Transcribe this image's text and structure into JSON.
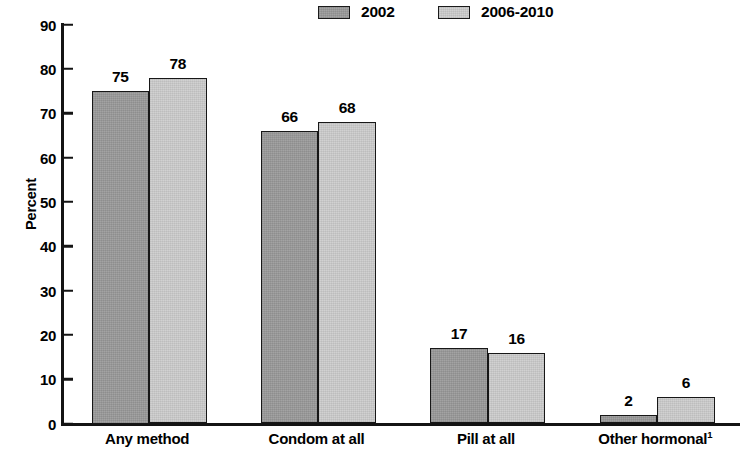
{
  "chart_data": {
    "type": "bar",
    "title": "",
    "subtitle": "",
    "xlabel": "",
    "ylabel": "Percent",
    "ylim": [
      0,
      90
    ],
    "ytick_step": 10,
    "yticks": [
      "90",
      "80",
      "70",
      "60",
      "50",
      "40",
      "30",
      "20",
      "10",
      "0"
    ],
    "grid": false,
    "legend_position": "top-center",
    "categories": [
      "Any method",
      "Condom at all",
      "Pill at all",
      "Other hormonal"
    ],
    "category_footnotes": [
      "",
      "",
      "",
      "1"
    ],
    "series": [
      {
        "name": "2002",
        "color": "#9a9a9a",
        "values": [
          75,
          66,
          17,
          2
        ]
      },
      {
        "name": "2006-2010",
        "color": "#cdcdcd",
        "values": [
          78,
          68,
          16,
          6
        ]
      }
    ],
    "bar_labels": [
      [
        "75",
        "78"
      ],
      [
        "66",
        "68"
      ],
      [
        "17",
        "16"
      ],
      [
        "2",
        "6"
      ]
    ]
  },
  "legend": {
    "entries": [
      {
        "label": "2002",
        "swatch": "legend-swatch-dark"
      },
      {
        "label": "2006-2010",
        "swatch": "legend-swatch-light"
      }
    ]
  },
  "axis": {
    "y_title": "Percent"
  },
  "colors": {
    "series_2002": "#9a9a9a",
    "series_2006_2010": "#cdcdcd",
    "axis": "#141414",
    "background": "#ffffff"
  }
}
